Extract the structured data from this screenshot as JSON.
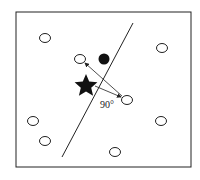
{
  "diagram": {
    "angle_label": "90°",
    "frame": {
      "x": 16,
      "y": 12,
      "w": 175,
      "h": 155
    },
    "separator_line": {
      "x1": 133,
      "y1": 23,
      "x2": 62,
      "y2": 157
    },
    "open_points": [
      {
        "x": 45,
        "y": 38
      },
      {
        "x": 162,
        "y": 48
      },
      {
        "x": 80,
        "y": 59
      },
      {
        "x": 127,
        "y": 100
      },
      {
        "x": 33,
        "y": 121
      },
      {
        "x": 161,
        "y": 121
      },
      {
        "x": 45,
        "y": 141
      },
      {
        "x": 115,
        "y": 152
      }
    ],
    "filled_point": {
      "x": 104,
      "y": 59
    },
    "star": {
      "x": 86,
      "y": 85
    },
    "colors": {
      "stroke": "#222222",
      "fill": "#111111",
      "background": "#ffffff"
    }
  }
}
